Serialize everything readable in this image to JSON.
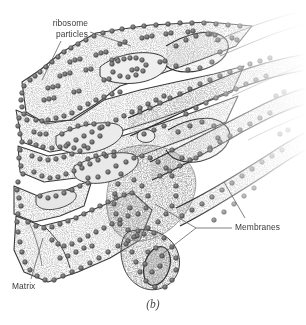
{
  "figure": {
    "caption": "(b)",
    "background_color": "#ffffff",
    "ink_color": "#2b2b2b",
    "matrix_fill_color": "#d8d8d8",
    "ribosome_color": "#6b6b6b",
    "leader_line_color": "#5a5a5a"
  },
  "labels": {
    "ribosome_particles": {
      "line1": "ribosome",
      "line2": "particles"
    },
    "membranes": "Membranes",
    "matrix": "Matrix"
  },
  "icons": {
    "leader_line": "leader-line",
    "ribosome": "ribosome-dot",
    "cisterna": "cisterna-sheet",
    "vesicle": "vesicle-oval"
  }
}
